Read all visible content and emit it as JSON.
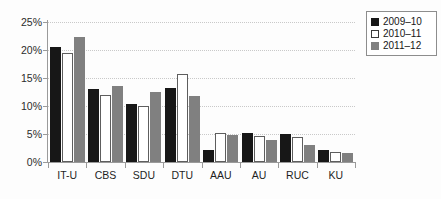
{
  "chart_data": {
    "type": "bar",
    "title": "",
    "xlabel": "",
    "ylabel": "",
    "categories": [
      "IT-U",
      "CBS",
      "SDU",
      "DTU",
      "AAU",
      "AU",
      "RUC",
      "KU"
    ],
    "series": [
      {
        "name": "2009–10",
        "color": "#171717",
        "values": [
          20.5,
          13.0,
          10.3,
          13.3,
          2.2,
          5.2,
          5.0,
          2.2
        ]
      },
      {
        "name": "2010–11",
        "color": "#ffffff",
        "values": [
          19.5,
          12.0,
          10.0,
          15.7,
          5.1,
          4.6,
          4.5,
          1.8
        ]
      },
      {
        "name": "2011–12",
        "color": "#808080",
        "values": [
          22.3,
          13.5,
          12.5,
          11.8,
          4.9,
          4.0,
          3.0,
          1.6
        ]
      }
    ],
    "ylim": [
      0,
      25
    ],
    "yticks": [
      0,
      5,
      10,
      15,
      20,
      25
    ],
    "ytick_labels": [
      "0%",
      "5%",
      "10%",
      "15%",
      "20%",
      "25%"
    ],
    "grid": true,
    "grid_style": "dotted",
    "legend_position": "top-right",
    "background_color": "#fdfdfd",
    "axis_color": "#9a9a9a"
  }
}
